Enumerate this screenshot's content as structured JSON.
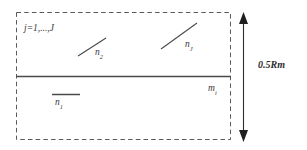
{
  "figure": {
    "title": "",
    "background_color": "#ffffff",
    "stroke_color": "#555555",
    "text_color": "#3a3a3a",
    "boundary": {
      "style": "dashed",
      "x": 16,
      "y": 12,
      "width": 215,
      "height": 128
    },
    "divider": {
      "style": "solid",
      "label": "m",
      "label_subscript": "i"
    },
    "region_upper": {
      "index_label": "j=1,...,J",
      "segments": [
        {
          "name": "n",
          "subscript": "2",
          "orientation": "diagonal",
          "x1": 78,
          "y1": 56,
          "x2": 106,
          "y2": 38
        },
        {
          "name": "n",
          "subscript": "J",
          "orientation": "diagonal",
          "x1": 161,
          "y1": 49,
          "x2": 197,
          "y2": 23
        }
      ]
    },
    "region_lower": {
      "segments": [
        {
          "name": "n",
          "subscript": "1",
          "orientation": "horizontal",
          "x1": 52,
          "y1": 94,
          "x2": 80,
          "y2": 94
        }
      ]
    },
    "dimension_arrow": {
      "label": "0.5Rm",
      "orientation": "vertical",
      "double_headed": true,
      "x": 243,
      "y_top": 14,
      "y_bottom": 140
    }
  }
}
